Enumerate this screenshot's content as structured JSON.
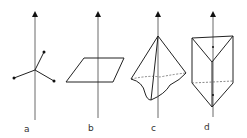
{
  "figure": {
    "panels": [
      {
        "label": "a",
        "shape": "three bonds radiating from axis point (pyramidal/star)"
      },
      {
        "label": "b",
        "shape": "parallelogram plane pierced by axis"
      },
      {
        "label": "c",
        "shape": "distorted pyramid / cone with dashed base"
      },
      {
        "label": "d",
        "shape": "triangular prism with dashed midline"
      }
    ],
    "colors": {
      "line": "#222222",
      "background": "#ffffff"
    }
  }
}
